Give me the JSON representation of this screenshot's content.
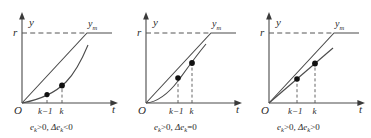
{
  "figure": {
    "type": "diagram",
    "panel_count": 3,
    "stroke_color": "#4a4a4a",
    "dash_color": "#555555",
    "text_color": "#2b2b2b",
    "marker_color": "#111111"
  },
  "axes": {
    "y_label": "y",
    "t_label": "t",
    "origin_label": "O",
    "reference_label": "r",
    "ym_label": "y",
    "ym_subscript": "m",
    "tick_k_minus_1": "k−1",
    "tick_k": "k"
  },
  "panels": [
    {
      "id": "panel-1",
      "caption_e": "e",
      "caption_e_sub": "k",
      "caption_e_rel": ">0,",
      "caption_delta": "Δe",
      "caption_delta_sub": "k",
      "caption_delta_rel": "<0",
      "caption_full": "e_k>0, Δe_k<0",
      "response_kind": "concave-up-slow",
      "markers": [
        {
          "t": "k−1",
          "y": 0.16
        },
        {
          "t": "k",
          "y": 0.245
        }
      ]
    },
    {
      "id": "panel-2",
      "caption_e": "e",
      "caption_e_sub": "k",
      "caption_e_rel": ">0,",
      "caption_delta": "Δe",
      "caption_delta_sub": "k",
      "caption_delta_rel": "=0",
      "caption_full": "e_k>0, Δe_k=0",
      "response_kind": "concave-up-fast",
      "markers": [
        {
          "t": "k−1",
          "y": 0.39
        },
        {
          "t": "k",
          "y": 0.53
        }
      ]
    },
    {
      "id": "panel-3",
      "caption_e": "e",
      "caption_e_sub": "k",
      "caption_e_rel": ">0,",
      "caption_delta": "Δe",
      "caption_delta_sub": "k",
      "caption_delta_rel": ">0",
      "caption_full": "e_k>0, Δe_k>0",
      "response_kind": "linear-shallow",
      "markers": [
        {
          "t": "k−1",
          "y": 0.33
        },
        {
          "t": "k",
          "y": 0.45
        }
      ]
    }
  ]
}
